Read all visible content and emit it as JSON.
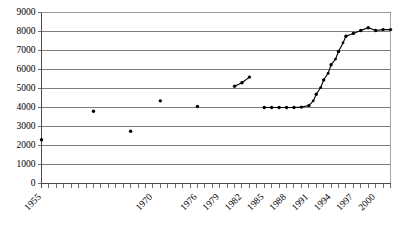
{
  "chart_data": {
    "type": "line",
    "title": "",
    "subtitle": "",
    "xlabel": "",
    "ylabel": "",
    "xlim": [
      1955,
      2002
    ],
    "ylim": [
      0,
      9000
    ],
    "grid": true,
    "legend": false,
    "legend_position": "none",
    "y_ticks": [
      0,
      1000,
      2000,
      3000,
      4000,
      5000,
      6000,
      7000,
      8000,
      9000
    ],
    "y_tick_labels": [
      "0",
      "1000",
      "2000",
      "3000",
      "4000",
      "5000",
      "6000",
      "7000",
      "8000",
      "9000"
    ],
    "x_tick_labels": [
      "1955",
      "1970",
      "1976",
      "1979",
      "1982",
      "1985",
      "1988",
      "1991",
      "1994",
      "1997",
      "2000"
    ],
    "x_tick_label_years": [
      1955,
      1970,
      1976,
      1979,
      1982,
      1985,
      1988,
      1991,
      1994,
      1997,
      2000
    ],
    "x_minor_tick_interval": 1,
    "x_label_rotation_deg": -45,
    "marker": "dot",
    "marker_color": "#000000",
    "line_color": "#000000",
    "grid_color": "#6f6f6f",
    "segments": [
      {
        "name": "isolated-early-observations",
        "connected": false,
        "points": [
          {
            "x": 1955,
            "y": 2300
          },
          {
            "x": 1962,
            "y": 3800
          },
          {
            "x": 1967,
            "y": 2750
          },
          {
            "x": 1971,
            "y": 4350
          },
          {
            "x": 1976,
            "y": 4050
          }
        ]
      },
      {
        "name": "early-eighties-series",
        "connected": true,
        "points": [
          {
            "x": 1981,
            "y": 5120
          },
          {
            "x": 1982,
            "y": 5300
          },
          {
            "x": 1983,
            "y": 5600
          }
        ]
      },
      {
        "name": "main-series",
        "connected": true,
        "points": [
          {
            "x": 1985,
            "y": 4000
          },
          {
            "x": 1986,
            "y": 4000
          },
          {
            "x": 1987,
            "y": 4000
          },
          {
            "x": 1988,
            "y": 4000
          },
          {
            "x": 1989,
            "y": 4000
          },
          {
            "x": 1990,
            "y": 4020
          },
          {
            "x": 1991,
            "y": 4100
          },
          {
            "x": 1991.6,
            "y": 4350
          },
          {
            "x": 1992,
            "y": 4700
          },
          {
            "x": 1992.6,
            "y": 5050
          },
          {
            "x": 1993,
            "y": 5450
          },
          {
            "x": 1993.6,
            "y": 5800
          },
          {
            "x": 1994,
            "y": 6250
          },
          {
            "x": 1994.6,
            "y": 6550
          },
          {
            "x": 1995,
            "y": 6950
          },
          {
            "x": 1995.6,
            "y": 7400
          },
          {
            "x": 1996,
            "y": 7750
          },
          {
            "x": 1997,
            "y": 7900
          },
          {
            "x": 1998,
            "y": 8050
          },
          {
            "x": 1999,
            "y": 8200
          },
          {
            "x": 2000,
            "y": 8050
          },
          {
            "x": 2001,
            "y": 8100
          },
          {
            "x": 2002,
            "y": 8100
          }
        ]
      }
    ]
  }
}
